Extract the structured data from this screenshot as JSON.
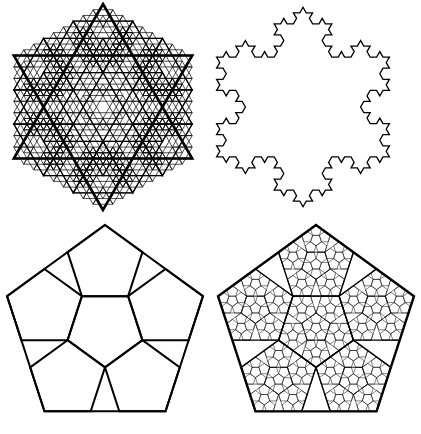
{
  "figure": {
    "background": "#ffffff",
    "stroke_color": "#000000",
    "panels": [
      {
        "id": "koch-star-fractal",
        "type": "hexagram-fractal",
        "position": "top-left",
        "center": [
          103,
          107
        ],
        "radius": 103,
        "levels": 3,
        "stroke_widths": [
          2.6,
          1.3,
          0.7
        ]
      },
      {
        "id": "koch-snowflake",
        "type": "koch-snowflake-outline",
        "position": "top-right",
        "center": [
          303,
          107
        ],
        "radius": 100,
        "iterations": 3,
        "stroke_width": 1.3
      },
      {
        "id": "pentaflake-level-1",
        "type": "pentagon-subdivision",
        "position": "bottom-left",
        "center": [
          105,
          328
        ],
        "radius": 103,
        "levels": 1,
        "stroke_widths": [
          2.0
        ]
      },
      {
        "id": "pentaflake-level-3",
        "type": "pentagon-subdivision",
        "position": "bottom-right",
        "center": [
          316,
          328
        ],
        "radius": 103,
        "levels": 3,
        "stroke_widths": [
          2.4,
          1.4,
          0.5
        ]
      }
    ]
  }
}
